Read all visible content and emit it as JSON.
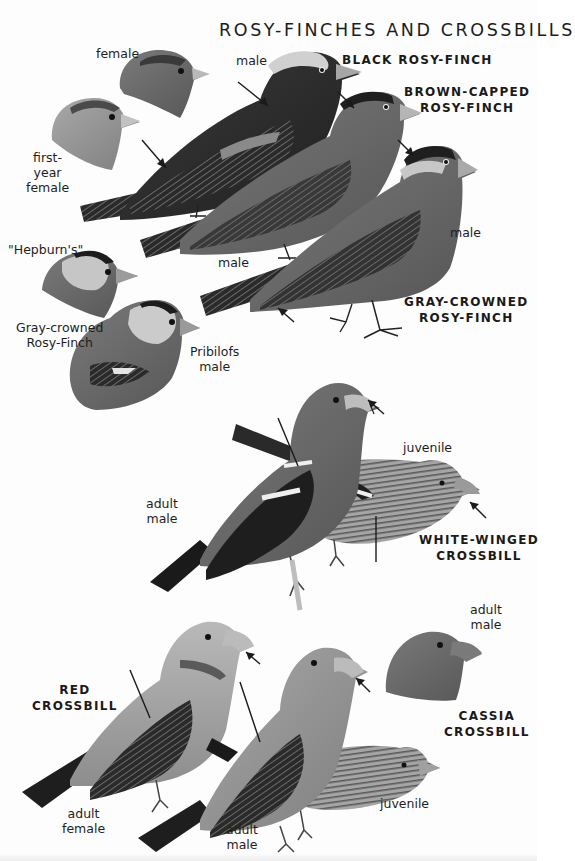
{
  "page": {
    "title": "ROSY-FINCHES AND CROSSBILLS"
  },
  "species": {
    "black_rosy_finch": {
      "line1": "BLACK ROSY-FINCH"
    },
    "brown_capped_rosy_finch": {
      "line1": "BROWN-CAPPED",
      "line2": "ROSY-FINCH"
    },
    "gray_crowned_rosy_finch": {
      "line1": "GRAY-CROWNED",
      "line2": "ROSY-FINCH"
    },
    "white_winged_crossbill": {
      "line1": "WHITE-WINGED",
      "line2": "CROSSBILL"
    },
    "red_crossbill": {
      "line1": "RED",
      "line2": "CROSSBILL"
    },
    "cassia_crossbill": {
      "line1": "CASSIA",
      "line2": "CROSSBILL"
    }
  },
  "labels": {
    "black_female": "female",
    "black_first_year_female": {
      "line1": "first-",
      "line2": "year",
      "line3": "female"
    },
    "black_male": "male",
    "brown_capped_male": "male",
    "gray_crowned_male": "male",
    "hepburns": "\"Hepburn's\"",
    "gray_crowned_subspecies": {
      "line1": "Gray-crowned",
      "line2": "Rosy-Finch"
    },
    "pribilofs_male": {
      "line1": "Pribilofs",
      "line2": "male"
    },
    "ww_adult_male": {
      "line1": "adult",
      "line2": "male"
    },
    "ww_juvenile": "juvenile",
    "red_adult_female": {
      "line1": "adult",
      "line2": "female"
    },
    "red_adult_male": {
      "line1": "adult",
      "line2": "male"
    },
    "red_juvenile": "juvenile",
    "cassia_adult_male": {
      "line1": "adult",
      "line2": "male"
    }
  },
  "colors": {
    "background": "#fdfdfd",
    "text": "#1a1a1a",
    "bird_dark": "#2e2e2e",
    "bird_mid": "#6a6a6a",
    "bird_light": "#9a9a9a",
    "pale_crown": "#cfcfcf"
  }
}
